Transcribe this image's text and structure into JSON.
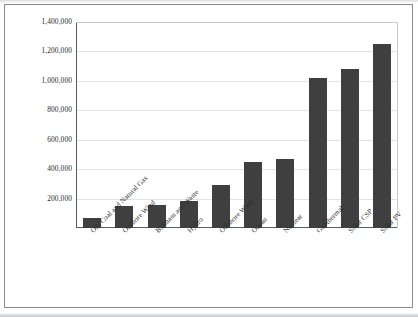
{
  "chart_data": {
    "type": "bar",
    "title": "",
    "subtitle": "",
    "xlabel": "",
    "ylabel": "",
    "ylim": [
      0,
      1400000
    ],
    "grid": true,
    "legend": false,
    "legend_position": "none",
    "orientation": "vertical",
    "bar_color": "#3f3f3f",
    "categories": [
      "Oil, Coal and Natural Gas",
      "Onshore Wind",
      "Biomass and Waste",
      "Hydro",
      "Offshore Wind",
      "Ocean",
      "Nuclear",
      "Geothermal",
      "Solar CSP",
      "Solar PV"
    ],
    "values": [
      70000,
      150000,
      155000,
      185000,
      290000,
      450000,
      470000,
      1020000,
      1080000,
      1250000
    ],
    "y_ticks": [
      0,
      200000,
      400000,
      600000,
      800000,
      1000000,
      1200000,
      1400000
    ],
    "y_tick_labels": [
      "",
      "200,000",
      "400,000",
      "600,000",
      "800,000",
      "1,000,000",
      "1,200,000",
      "1,400,000"
    ]
  },
  "axis": {
    "y_labels": [
      "1,400,000",
      "1,200,000",
      "1,000,000",
      "800,000",
      "600,000",
      "400,000",
      "200,000"
    ],
    "x_labels": [
      "Oil, Coal and Natural Gas",
      "Onshore Wind",
      "Biomass and Waste",
      "Hydro",
      "Offshore Wind",
      "Ocean",
      "Nuclear",
      "Geothermal",
      "Solar CSP",
      "Solar PV"
    ]
  }
}
